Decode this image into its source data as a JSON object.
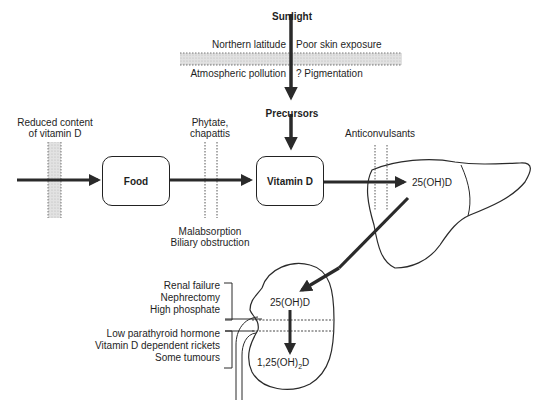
{
  "diagram": {
    "sources": {
      "sunlight": "Sunlight",
      "precursors": "Precursors"
    },
    "nodes": {
      "food": "Food",
      "vitamin_d": "Vitamin D",
      "liver_product": "25(OH)D",
      "kidney_input": "25(OH)D",
      "kidney_output_prefix": "1,25(OH)",
      "kidney_output_sub": "2",
      "kidney_output_suffix": "D"
    },
    "barriers": {
      "sunlight_barrier": {
        "top_left": "Northern latitude",
        "top_right": "Poor skin exposure",
        "bottom_left": "Atmospheric pollution",
        "bottom_right": "? Pigmentation"
      },
      "dietary": {
        "line1": "Reduced content",
        "line2": "of vitamin D"
      },
      "absorption_top": {
        "line1": "Phytate,",
        "line2": "chapattis"
      },
      "absorption_bottom": {
        "line1": "Malabsorption",
        "line2": "Biliary obstruction"
      },
      "liver": "Anticonvulsants"
    },
    "kidney_factors": {
      "group1": [
        "Renal failure",
        "Nephrectomy",
        "High phosphate"
      ],
      "group2": [
        "Low parathyroid hormone",
        "Vitamin D dependent rickets",
        "Some tumours"
      ]
    },
    "organs": {
      "liver": "liver-outline",
      "kidney": "kidney-outline"
    }
  }
}
